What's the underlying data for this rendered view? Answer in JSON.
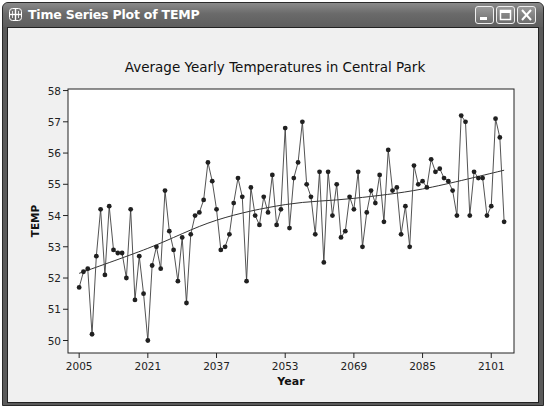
{
  "window": {
    "title": "Time Series Plot of TEMP",
    "icon": "grid-window-icon",
    "buttons": [
      "minimize",
      "maximize",
      "close"
    ]
  },
  "chart_data": {
    "type": "line",
    "title": "Average Yearly Temperatures in Central Park",
    "xlabel": "Year",
    "ylabel": "TEMP",
    "ylim": [
      49.6,
      58.05
    ],
    "xlim": [
      2002.4,
      2106.3
    ],
    "yticks": [
      50,
      51,
      52,
      53,
      54,
      55,
      56,
      57,
      58
    ],
    "xticks": [
      2005,
      2021,
      2037,
      2053,
      2069,
      2085,
      2101
    ],
    "grid": false,
    "legend": "none",
    "x_start": 2005,
    "series": [
      {
        "name": "TEMP",
        "marker": "circle",
        "values": [
          51.7,
          52.2,
          52.3,
          50.2,
          52.7,
          54.2,
          52.1,
          54.3,
          52.9,
          52.8,
          52.8,
          52.0,
          54.2,
          51.3,
          52.7,
          51.5,
          50.0,
          52.4,
          53.0,
          52.3,
          54.8,
          53.5,
          52.9,
          51.9,
          53.3,
          51.2,
          53.4,
          54.0,
          54.1,
          54.5,
          55.7,
          55.1,
          54.2,
          52.9,
          53.0,
          53.4,
          54.4,
          55.2,
          54.6,
          51.9,
          54.9,
          54.0,
          53.7,
          54.6,
          54.1,
          55.3,
          53.7,
          54.2,
          56.8,
          53.6,
          55.2,
          55.7,
          57.0,
          55.0,
          54.6,
          53.4,
          55.4,
          52.5,
          55.4,
          54.0,
          55.0,
          53.3,
          53.5,
          54.6,
          54.2,
          55.4,
          53.0,
          54.1,
          54.8,
          54.4,
          55.3,
          53.8,
          56.1,
          54.8,
          54.9,
          53.4,
          54.3,
          53.0,
          55.6,
          55.0,
          55.1,
          54.9,
          55.8,
          55.4,
          55.5,
          55.2,
          55.1,
          54.8,
          54.0,
          57.2,
          57.0,
          54.0,
          55.4,
          55.2,
          55.2,
          54.0,
          54.3,
          57.1,
          56.5,
          53.8
        ]
      },
      {
        "name": "Trend",
        "marker": "none",
        "values_at": {
          "x": [
            2005,
            2021,
            2037,
            2053,
            2069,
            2085,
            2104
          ],
          "y": [
            52.15,
            52.95,
            53.85,
            54.35,
            54.55,
            54.85,
            55.45
          ]
        }
      }
    ]
  },
  "colors": {
    "titlebar": "#6e6e6e",
    "title_text": "#ffffff",
    "chart_background": "#f0f0f0",
    "plot_background": "#ffffff",
    "series_line": "#404040",
    "markers": "#202020"
  }
}
